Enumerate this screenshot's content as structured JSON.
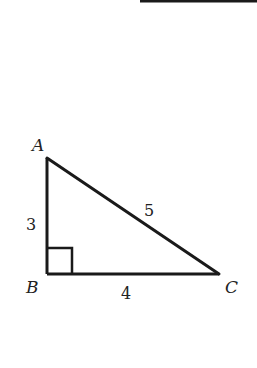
{
  "diagram": {
    "type": "right-triangle",
    "colors": {
      "stroke": "#1a1a1a",
      "text": "#222222",
      "background": "#ffffff"
    },
    "top_rule": {
      "x1": 140,
      "y1": 1,
      "x2": 257,
      "y2": 1
    },
    "vertices": {
      "A": {
        "label": "A",
        "x": 47,
        "y": 158
      },
      "B": {
        "label": "B",
        "x": 47,
        "y": 274
      },
      "C": {
        "label": "C",
        "x": 219,
        "y": 274
      }
    },
    "sides": {
      "AB": {
        "label": "3"
      },
      "BC": {
        "label": "4"
      },
      "AC": {
        "label": "5"
      }
    },
    "right_angle_at": "B"
  }
}
